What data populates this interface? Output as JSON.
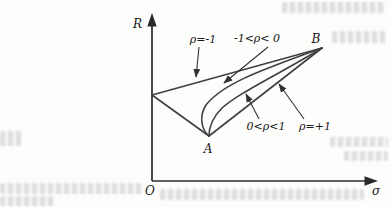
{
  "diagram": {
    "axis": {
      "y_label": "R",
      "x_label": "σ",
      "origin_label": "O"
    },
    "points": {
      "a_label": "A",
      "b_label": "B"
    },
    "curve_labels": {
      "rho_neg1": "ρ=-1",
      "rho_neg_range": "-1<ρ< 0",
      "rho_pos_range": "0<ρ<1",
      "rho_pos1": "ρ=+1"
    },
    "colors": {
      "curve_line": "#404040",
      "axis_line": "#2a2a2a",
      "label_text": "#171717",
      "background": "#fdfdfc",
      "bleed_artifact": "#949c97"
    }
  }
}
